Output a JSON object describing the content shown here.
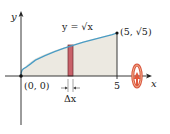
{
  "figure": {
    "type": "diagram",
    "curve_label": "y = √x",
    "curve_label_parts": {
      "lhs": "y",
      "eq": " = ",
      "sqrt": "√",
      "arg": "x"
    },
    "endpoint_label": "(5, √5)",
    "origin_label": "(0, 0)",
    "x_tick_label": "5",
    "x_axis_label": "x",
    "y_axis_label": "y",
    "strip_width_label": "Δx",
    "rotation_icon": "rotate-about-x-axis-icon",
    "colors": {
      "curve": "#4a9cc4",
      "region_fill": "#ece9e1",
      "strip_fill": "#c9626a",
      "strip_stroke": "#6b2a2e",
      "axis": "#222222",
      "rotation_arrow": "#d9553f"
    },
    "geometry": {
      "x_range": [
        0,
        5
      ],
      "curve": "sqrt",
      "strip_x": [
        2.45,
        2.7
      ]
    }
  }
}
